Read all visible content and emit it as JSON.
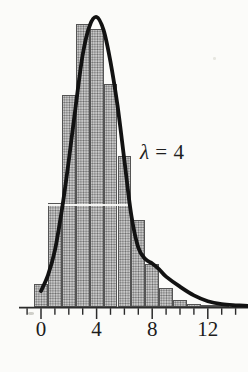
{
  "figure": {
    "background": "#fbfbf9",
    "annotation": {
      "full": "λ = 4",
      "lambda": "λ",
      "rest": " = 4"
    }
  },
  "chart_data": {
    "type": "bar",
    "subtype": "histogram_with_density_curve",
    "title": "",
    "annotation": "λ = 4",
    "categories": [
      0,
      1,
      2,
      3,
      4,
      5,
      6,
      7,
      8,
      9,
      10,
      11,
      12,
      13
    ],
    "values": [
      0.016,
      0.072,
      0.146,
      0.195,
      0.192,
      0.154,
      0.104,
      0.06,
      0.03,
      0.013,
      0.005,
      0.002,
      0.001,
      0.0005
    ],
    "bar_width_units": 1,
    "x_major_ticks": [
      0,
      4,
      8,
      12
    ],
    "x_tick_labels": [
      "0",
      "4",
      "8",
      "12"
    ],
    "x_minor_ticks": [
      -1,
      1,
      2,
      3,
      5,
      6,
      7,
      9,
      10,
      11,
      13,
      14
    ],
    "xlim": [
      -1.5,
      14.9
    ],
    "ylim": [
      0,
      0.2
    ],
    "grid": false,
    "legend": false,
    "curve_points": [
      [
        0,
        0.011
      ],
      [
        0.5,
        0.022
      ],
      [
        1,
        0.039
      ],
      [
        1.5,
        0.067
      ],
      [
        2,
        0.101
      ],
      [
        2.5,
        0.139
      ],
      [
        3,
        0.174
      ],
      [
        3.5,
        0.194
      ],
      [
        4,
        0.2
      ],
      [
        4.5,
        0.191
      ],
      [
        5,
        0.169
      ],
      [
        5.5,
        0.139
      ],
      [
        6,
        0.101
      ],
      [
        6.5,
        0.063
      ],
      [
        7,
        0.041
      ],
      [
        7.5,
        0.033
      ],
      [
        8,
        0.03
      ],
      [
        8.5,
        0.026
      ],
      [
        9,
        0.021
      ],
      [
        10,
        0.014
      ],
      [
        11,
        0.008
      ],
      [
        12,
        0.004
      ],
      [
        13,
        0.002
      ],
      [
        14,
        0.0012
      ],
      [
        14.9,
        0.0008
      ]
    ],
    "colors": {
      "bar_fill": "#c9c9c9",
      "bar_halftone_dot": "#525252",
      "bar_border": "#545454",
      "curve": "#121212",
      "axis": "#2b2b2b",
      "text": "#1c1c1c",
      "background": "#fbfbf9"
    }
  }
}
